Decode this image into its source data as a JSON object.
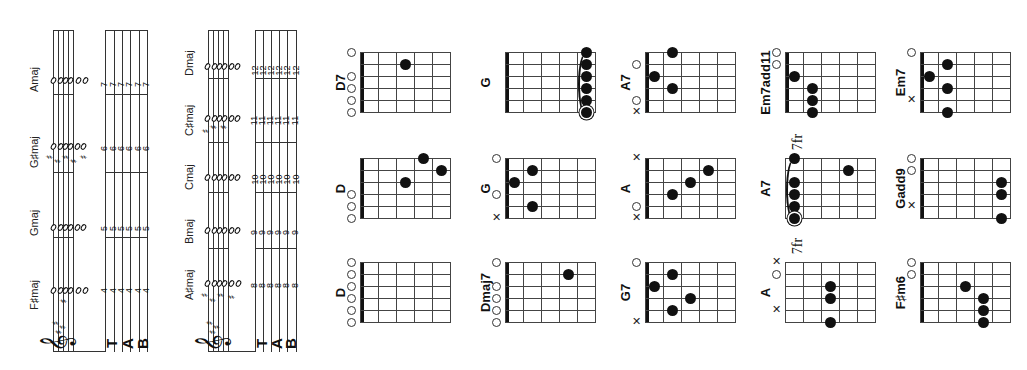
{
  "page": {
    "orientation": "rotated-90-ccw",
    "background": "#ffffff"
  },
  "systems": [
    {
      "id": "system-1",
      "key_signature": "##",
      "tab_label": [
        "T",
        "A",
        "B"
      ],
      "chords": [
        {
          "name": "F♯maj",
          "fret": "4",
          "tab": [
            "4",
            "4",
            "4",
            "4",
            "4",
            "4"
          ]
        },
        {
          "name": "Gmaj",
          "fret": "5",
          "tab": [
            "5",
            "5",
            "5",
            "5",
            "5",
            "5"
          ]
        },
        {
          "name": "G♯maj",
          "fret": "6",
          "tab": [
            "6",
            "6",
            "6",
            "6",
            "6",
            "6"
          ]
        },
        {
          "name": "Amaj",
          "fret": "7",
          "tab": [
            "7",
            "7",
            "7",
            "7",
            "7",
            "7"
          ]
        }
      ]
    },
    {
      "id": "system-2",
      "key_signature": "##",
      "tab_label": [
        "T",
        "A",
        "B"
      ],
      "chords": [
        {
          "name": "A♯maj",
          "fret": "8",
          "tab": [
            "8",
            "8",
            "8",
            "8",
            "8",
            "8"
          ]
        },
        {
          "name": "Bmaj",
          "fret": "9",
          "tab": [
            "9",
            "9",
            "9",
            "9",
            "9",
            "9"
          ]
        },
        {
          "name": "Cmaj",
          "fret": "10",
          "tab": [
            "10",
            "10",
            "10",
            "10",
            "10",
            "10"
          ]
        },
        {
          "name": "C♯maj",
          "fret": "11",
          "tab": [
            "11",
            "11",
            "11",
            "11",
            "11",
            "11"
          ]
        },
        {
          "name": "Dmaj",
          "fret": "12",
          "tab": [
            "12",
            "12",
            "12",
            "12",
            "12",
            "12"
          ]
        }
      ]
    }
  ],
  "chord_diagrams": {
    "columns": [
      {
        "col": 1,
        "diagrams": [
          {
            "name": "D7",
            "markers": [
              "o",
              "",
              "o",
              "o",
              "o",
              "o"
            ],
            "dots": [
              {
                "string": 2,
                "fret": 3
              }
            ],
            "barre": false,
            "fret_label": ""
          },
          {
            "name": "D",
            "markers": [
              "",
              "",
              "",
              "o",
              "o",
              "o"
            ],
            "dots": [
              {
                "string": 1,
                "fret": 4
              },
              {
                "string": 2,
                "fret": 5
              },
              {
                "string": 3,
                "fret": 3
              }
            ],
            "barre": false,
            "fret_label": ""
          },
          {
            "name": "D",
            "markers": [
              "o",
              "o",
              "o",
              "o",
              "o",
              "o"
            ],
            "dots": [],
            "barre": false,
            "fret_label": ""
          }
        ]
      },
      {
        "col": 2,
        "diagrams": [
          {
            "name": "G",
            "markers": [
              "",
              "",
              "",
              "",
              "",
              ""
            ],
            "dots": [
              {
                "string": 1,
                "fret": 5
              },
              {
                "string": 2,
                "fret": 5
              },
              {
                "string": 3,
                "fret": 5
              },
              {
                "string": 4,
                "fret": 5
              },
              {
                "string": 5,
                "fret": 5
              },
              {
                "string": 6,
                "fret": 5
              }
            ],
            "barre": true,
            "fret_label": ""
          },
          {
            "name": "G",
            "markers": [
              "o",
              "",
              "",
              "o",
              "",
              "x"
            ],
            "dots": [
              {
                "string": 2,
                "fret": 2
              },
              {
                "string": 3,
                "fret": 1
              },
              {
                "string": 5,
                "fret": 2
              }
            ],
            "barre": false,
            "fret_label": ""
          },
          {
            "name": "Dmaj7",
            "markers": [
              "o",
              "",
              "o",
              "o",
              "o",
              "o"
            ],
            "dots": [
              {
                "string": 2,
                "fret": 4
              }
            ],
            "barre": false,
            "fret_label": ""
          }
        ]
      },
      {
        "col": 3,
        "diagrams": [
          {
            "name": "A7",
            "markers": [
              "",
              "o",
              "",
              "",
              "o",
              "x"
            ],
            "dots": [
              {
                "string": 1,
                "fret": 2
              },
              {
                "string": 3,
                "fret": 1
              },
              {
                "string": 4,
                "fret": 2
              }
            ],
            "barre": false,
            "fret_label": ""
          },
          {
            "name": "A",
            "markers": [
              "x",
              "",
              "",
              "",
              "o",
              "x"
            ],
            "dots": [
              {
                "string": 2,
                "fret": 4
              },
              {
                "string": 3,
                "fret": 3
              },
              {
                "string": 4,
                "fret": 2
              }
            ],
            "barre": false,
            "fret_label": ""
          },
          {
            "name": "G7",
            "markers": [
              "o",
              "",
              "",
              "",
              "",
              "x"
            ],
            "dots": [
              {
                "string": 2,
                "fret": 2
              },
              {
                "string": 3,
                "fret": 1
              },
              {
                "string": 4,
                "fret": 3
              },
              {
                "string": 5,
                "fret": 2
              }
            ],
            "barre": false,
            "fret_label": ""
          }
        ]
      },
      {
        "col": 4,
        "diagrams": [
          {
            "name": "Em7add11",
            "markers": [
              "o",
              "o",
              "",
              "",
              "",
              ""
            ],
            "dots": [
              {
                "string": 3,
                "fret": 1
              },
              {
                "string": 4,
                "fret": 2
              },
              {
                "string": 5,
                "fret": 2
              },
              {
                "string": 6,
                "fret": 2
              }
            ],
            "barre": false,
            "fret_label": ""
          },
          {
            "name": "A7",
            "markers": [
              "",
              "",
              "",
              "",
              "",
              ""
            ],
            "dots": [
              {
                "string": 1,
                "fret": 1
              },
              {
                "string": 2,
                "fret": 4
              },
              {
                "string": 3,
                "fret": 1
              },
              {
                "string": 4,
                "fret": 1
              },
              {
                "string": 5,
                "fret": 1
              },
              {
                "string": 6,
                "fret": 1
              }
            ],
            "barre": true,
            "fret_label": "7fr"
          },
          {
            "name": "A",
            "markers": [
              "x",
              "o",
              "",
              "",
              "x",
              ""
            ],
            "dots": [
              {
                "string": 3,
                "fret": 3
              },
              {
                "string": 4,
                "fret": 3
              },
              {
                "string": 6,
                "fret": 3
              }
            ],
            "barre": false,
            "fret_label": "7fr"
          }
        ]
      },
      {
        "col": 5,
        "diagrams": [
          {
            "name": "Em7",
            "markers": [
              "o",
              "",
              "",
              "",
              "x",
              ""
            ],
            "dots": [
              {
                "string": 2,
                "fret": 2
              },
              {
                "string": 3,
                "fret": 1
              },
              {
                "string": 4,
                "fret": 2
              },
              {
                "string": 6,
                "fret": 2
              }
            ],
            "barre": false,
            "fret_label": ""
          },
          {
            "name": "Gadd9",
            "markers": [
              "o",
              "o",
              "",
              "",
              "x",
              ""
            ],
            "dots": [
              {
                "string": 3,
                "fret": 5
              },
              {
                "string": 4,
                "fret": 5
              },
              {
                "string": 6,
                "fret": 5
              }
            ],
            "barre": false,
            "fret_label": ""
          },
          {
            "name": "F♯m6",
            "markers": [
              "o",
              "o",
              "",
              "",
              "",
              ""
            ],
            "dots": [
              {
                "string": 3,
                "fret": 3
              },
              {
                "string": 4,
                "fret": 4
              },
              {
                "string": 5,
                "fret": 4
              },
              {
                "string": 6,
                "fret": 4
              }
            ],
            "barre": false,
            "fret_label": ""
          }
        ]
      }
    ]
  }
}
